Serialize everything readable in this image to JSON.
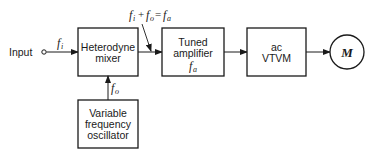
{
  "diagram": {
    "type": "block-diagram",
    "input": {
      "label": "Input",
      "signal": "f",
      "signal_sub": "i"
    },
    "blocks": [
      {
        "id": "mixer",
        "lines": [
          "Heterodyne",
          "mixer"
        ]
      },
      {
        "id": "amplifier",
        "lines": [
          "Tuned",
          "amplifier"
        ],
        "freq": "f",
        "freq_sub": "a"
      },
      {
        "id": "vtvm",
        "lines": [
          "ac",
          "VTVM"
        ]
      },
      {
        "id": "oscillator",
        "lines": [
          "Variable",
          "frequency",
          "oscillator"
        ]
      }
    ],
    "meter": {
      "label": "M"
    },
    "oscillator_signal": {
      "f": "f",
      "sub": "o"
    },
    "equation": {
      "t1": "f",
      "s1": "i",
      "plus": "+",
      "t2": "f",
      "s2": "o",
      "eq": "=",
      "t3": "f",
      "s3": "a"
    },
    "colors": {
      "line": "#1a1a1a",
      "background": "#ffffff"
    }
  }
}
